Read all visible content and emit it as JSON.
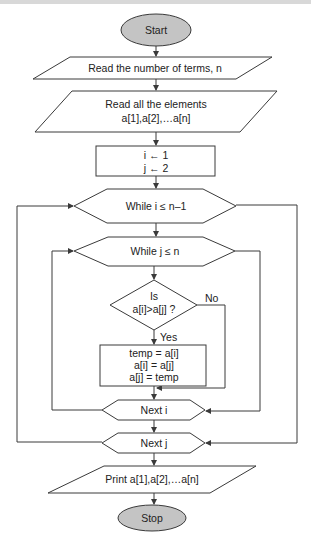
{
  "diagram": {
    "type": "flowchart",
    "colors": {
      "line": "#3a3a3a",
      "terminal_fill": "#c4c4c4",
      "shape_fill": "#ffffff"
    },
    "nodes": {
      "start": {
        "shape": "terminal",
        "label": "Start"
      },
      "read_n": {
        "shape": "input-output",
        "label": "Read the number of terms, n"
      },
      "read_elements": {
        "shape": "input-output",
        "line1": "Read all the elements",
        "line2": "a[1],a[2],…a[n]"
      },
      "init": {
        "shape": "process",
        "line1": "i ← 1",
        "line2": "j ← 2"
      },
      "loop_i": {
        "shape": "loop",
        "label": "While i ≤ n–1"
      },
      "loop_j": {
        "shape": "loop",
        "label": "While j ≤ n"
      },
      "compare": {
        "shape": "decision",
        "line1": "Is",
        "line2": "a[i]>a[j] ?"
      },
      "swap": {
        "shape": "process",
        "line1": "temp = a[i]",
        "line2": "a[i] = a[j]",
        "line3": "a[j] = temp"
      },
      "next_i": {
        "shape": "loop",
        "label": "Next i"
      },
      "next_j": {
        "shape": "loop",
        "label": "Next j"
      },
      "print": {
        "shape": "input-output",
        "label": "Print a[1],a[2],…a[n]"
      },
      "stop": {
        "shape": "terminal",
        "label": "Stop"
      }
    },
    "edge_labels": {
      "yes": "Yes",
      "no": "No"
    },
    "edges": [
      [
        "start",
        "read_n"
      ],
      [
        "read_n",
        "read_elements"
      ],
      [
        "read_elements",
        "init"
      ],
      [
        "init",
        "loop_i"
      ],
      [
        "loop_i",
        "loop_j"
      ],
      [
        "loop_j",
        "compare"
      ],
      [
        "compare",
        "swap",
        "Yes"
      ],
      [
        "compare",
        "next_i",
        "No"
      ],
      [
        "swap",
        "next_i"
      ],
      [
        "next_i",
        "loop_j"
      ],
      [
        "loop_j",
        "next_i"
      ],
      [
        "next_i",
        "next_j"
      ],
      [
        "next_j",
        "loop_i"
      ],
      [
        "loop_i",
        "next_j"
      ],
      [
        "next_j",
        "print"
      ],
      [
        "print",
        "stop"
      ]
    ]
  }
}
